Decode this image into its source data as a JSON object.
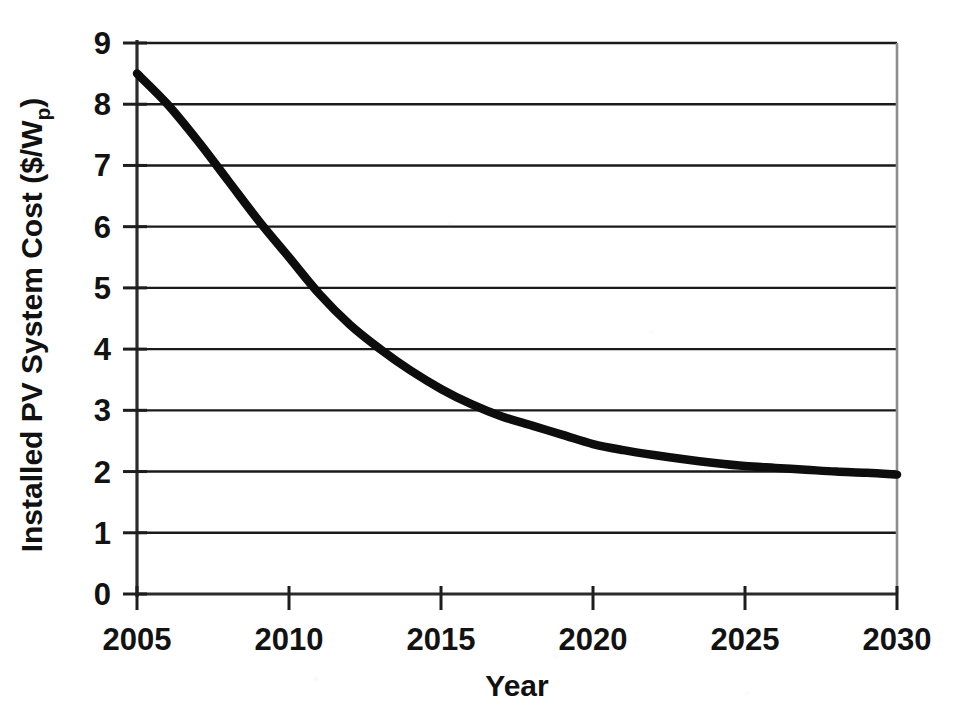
{
  "chart_data": {
    "type": "line",
    "title": "",
    "subtitle": "",
    "xlabel": "Year",
    "ylabel": "Installed PV System Cost ($/Wp)",
    "ylabel_main": "Installed PV System Cost ($/W",
    "ylabel_sub": "p",
    "ylabel_tail": ")",
    "xlim": [
      2005,
      2030
    ],
    "ylim": [
      0,
      9
    ],
    "grid": "horizontal",
    "legend": "none",
    "x_ticks": [
      2005,
      2010,
      2015,
      2020,
      2025,
      2030
    ],
    "x_tick_labels": [
      "2005",
      "2010",
      "2015",
      "2020",
      "2025",
      "2030"
    ],
    "y_ticks": [
      0,
      1,
      2,
      3,
      4,
      5,
      6,
      7,
      8,
      9
    ],
    "y_tick_labels": [
      "0",
      "1",
      "2",
      "3",
      "4",
      "5",
      "6",
      "7",
      "8",
      "9"
    ],
    "series": [
      {
        "name": "Installed PV System Cost",
        "color": "#0d0d0d",
        "x": [
          2005,
          2006,
          2007,
          2008,
          2009,
          2010,
          2011,
          2012,
          2013,
          2014,
          2015,
          2016,
          2017,
          2018,
          2019,
          2020,
          2021,
          2022,
          2023,
          2024,
          2025,
          2026,
          2027,
          2028,
          2029,
          2030
        ],
        "values": [
          8.5,
          8.0,
          7.4,
          6.75,
          6.1,
          5.5,
          4.9,
          4.4,
          4.0,
          3.65,
          3.35,
          3.1,
          2.9,
          2.75,
          2.6,
          2.45,
          2.35,
          2.27,
          2.2,
          2.14,
          2.09,
          2.06,
          2.03,
          2.0,
          1.98,
          1.95
        ]
      }
    ],
    "annotations": []
  },
  "colors": {
    "line": "#0d0d0d",
    "grid": "#1a1a1a",
    "axis": "#2b2b2b",
    "frame": "#8d8d8d",
    "background": "#ffffff",
    "text": "#111111"
  }
}
